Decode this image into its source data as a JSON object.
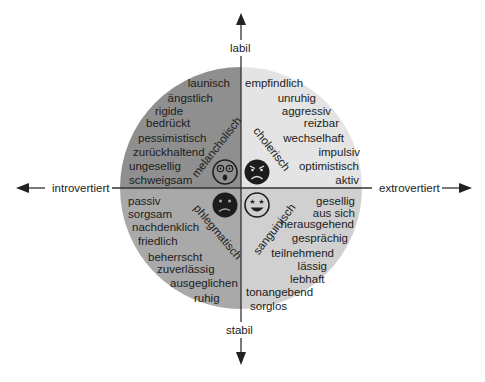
{
  "axes": {
    "top": "labil",
    "bottom": "stabil",
    "left": "introvertiert",
    "right": "extrovertiert"
  },
  "colors": {
    "melancholic": "#8f8f8f",
    "choleric": "#e4e4e4",
    "phlegmatic": "#a9a9a9",
    "sanguine": "#d0d0d0",
    "axis": "#333333"
  },
  "quadrants": {
    "melancholic": {
      "name": "melancholisch",
      "face": "shocked-face-icon",
      "traits": [
        "launisch",
        "ängstlich",
        "rigide",
        "bedrückt",
        "pessimistisch",
        "zurückhaltend",
        "ungesellig",
        "schweigsam"
      ]
    },
    "choleric": {
      "name": "cholerisch",
      "face": "angry-face-icon",
      "traits": [
        "empfindlich",
        "unruhig",
        "aggressiv",
        "reizbar",
        "wechselhaft",
        "impulsiv",
        "optimistisch",
        "aktiv"
      ]
    },
    "phlegmatic": {
      "name": "phlegmatisch",
      "face": "sad-face-icon",
      "traits": [
        "passiv",
        "sorgsam",
        "nachdenklich",
        "friedlich",
        "beherrscht",
        "zuverlässig",
        "ausgeglichen",
        "ruhig"
      ]
    },
    "sanguine": {
      "name": "sanguinisch",
      "face": "starry-eyed-face-icon",
      "traits": [
        "gesellig",
        "aus sich",
        "herausgehend",
        "gesprächig",
        "teilnehmend",
        "lässig",
        "lebhaft",
        "tonangebend",
        "sorglos"
      ]
    }
  }
}
